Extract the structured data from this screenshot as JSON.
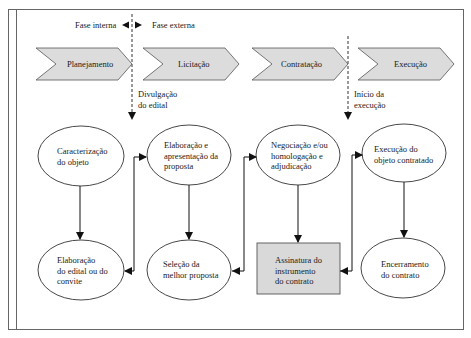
{
  "phase_divider": {
    "left_label": "Fase interna",
    "right_label": "Fase externa"
  },
  "stages": [
    {
      "label": "Planejamento"
    },
    {
      "label": "Licitação"
    },
    {
      "label": "Contratação"
    },
    {
      "label": "Execução"
    }
  ],
  "milestones": [
    {
      "line1": "Divulgação",
      "line2": "do edital"
    },
    {
      "line1": "Início da",
      "line2": "execução"
    }
  ],
  "nodes": {
    "caracterizacao": {
      "line1": "Caracterização",
      "line2": "do objeto"
    },
    "elaboracao_edital": {
      "line1": "Elaboração",
      "line2": "do edital ou do",
      "line3": "convite"
    },
    "elaboracao_proposta": {
      "line1": "Elaboração e",
      "line2": "apresentação da",
      "line3": "proposta"
    },
    "selecao": {
      "line1": "Seleção da",
      "line2": "melhor proposta"
    },
    "negociacao": {
      "line1": "Negociação e/ou",
      "line2": "homologação e",
      "line3": "adjudicação"
    },
    "assinatura": {
      "line1": "Assinatura do",
      "line2": "instrumento",
      "line3": "do contrato"
    },
    "execucao_objeto": {
      "line1": "Execução do",
      "line2": "objeto contratado"
    },
    "encerramento": {
      "line1": "Encerramento",
      "line2": "do contrato"
    }
  },
  "colors": {
    "chevron_fill": "#dcdcdc",
    "box_fill": "#d9d9d9",
    "stroke": "#222222",
    "frame": "#555555"
  }
}
